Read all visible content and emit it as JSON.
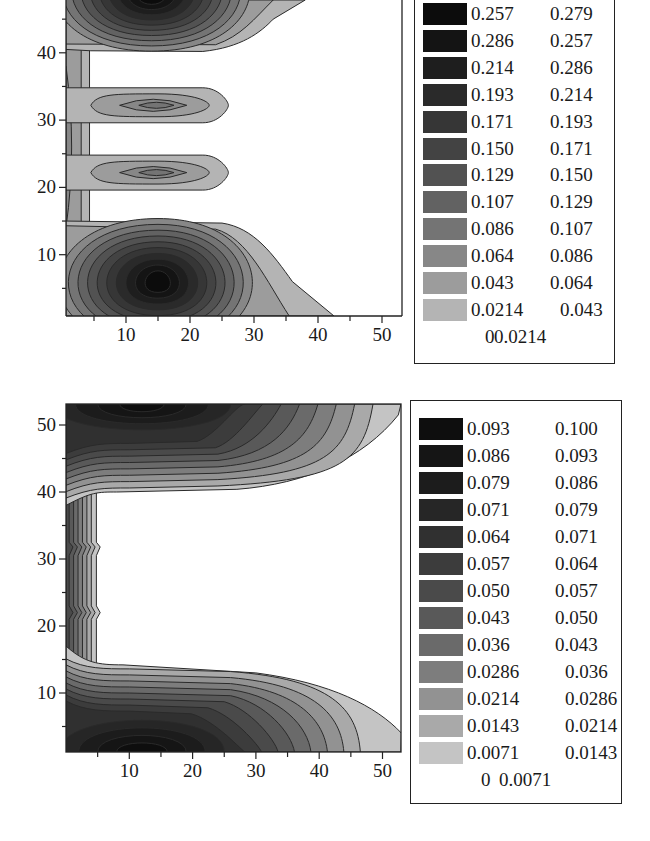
{
  "chart_data": [
    {
      "type": "contour",
      "title": "",
      "xlabel": "",
      "ylabel": "",
      "xlim": [
        0.6,
        53
      ],
      "ylim": [
        1,
        48
      ],
      "x_ticks": [
        10,
        20,
        30,
        40,
        50
      ],
      "y_ticks": [
        10,
        20,
        30,
        40
      ],
      "x_tick_labels": [
        "10",
        "20",
        "30",
        "40",
        "50"
      ],
      "y_tick_labels": [
        "10",
        "20",
        "30",
        "40"
      ],
      "grid": false,
      "legend_position": "right",
      "levels": [
        0,
        0.0214,
        0.043,
        0.064,
        0.086,
        0.107,
        0.129,
        0.15,
        0.171,
        0.193,
        0.214,
        0.286,
        0.257,
        0.279
      ],
      "legend": [
        {
          "lo": "0.257",
          "hi": "0.279",
          "color": "#0c0c0c"
        },
        {
          "lo": "0.286",
          "hi": "0.257",
          "color": "#141414"
        },
        {
          "lo": "0.214",
          "hi": "0.286",
          "color": "#1e1e1e"
        },
        {
          "lo": "0.193",
          "hi": "0.214",
          "color": "#2a2a2a"
        },
        {
          "lo": "0.171",
          "hi": "0.193",
          "color": "#363636"
        },
        {
          "lo": "0.150",
          "hi": "0.171",
          "color": "#434343"
        },
        {
          "lo": "0.129",
          "hi": "0.150",
          "color": "#525252"
        },
        {
          "lo": "0.107",
          "hi": "0.129",
          "color": "#626262"
        },
        {
          "lo": "0.086",
          "hi": "0.107",
          "color": "#747474"
        },
        {
          "lo": "0.064",
          "hi": "0.086",
          "color": "#878787"
        },
        {
          "lo": "0.043",
          "hi": "0.064",
          "color": "#9c9c9c"
        },
        {
          "lo": "0.0214",
          "hi": "0.043",
          "color": "#b4b4b4"
        },
        {
          "lo": "0",
          "hi": "0.0214",
          "color": "none"
        }
      ],
      "features": [
        {
          "kind": "peak",
          "x": 15,
          "y": 6,
          "max_level": 0.279,
          "extent_x": [
            1,
            43
          ],
          "extent_y": [
            1,
            15
          ]
        },
        {
          "kind": "peak",
          "x": 14,
          "y": 49,
          "max_level": 0.279,
          "extent_x": [
            1,
            38
          ],
          "extent_y": [
            40,
            48
          ]
        },
        {
          "kind": "ridge",
          "x": 15,
          "y": 32,
          "max_level": 0.086,
          "extent_x": [
            4,
            26
          ],
          "extent_y": [
            29.5,
            35
          ]
        },
        {
          "kind": "ridge",
          "x": 15,
          "y": 22,
          "max_level": 0.086,
          "extent_x": [
            4,
            26
          ],
          "extent_y": [
            19.5,
            25
          ]
        },
        {
          "kind": "band",
          "x": 2,
          "y": 25,
          "max_level": 0.064,
          "extent_x": [
            0.6,
            5
          ],
          "extent_y": [
            1,
            48
          ]
        }
      ]
    },
    {
      "type": "contour",
      "title": "",
      "xlabel": "",
      "ylabel": "",
      "xlim": [
        0,
        53
      ],
      "ylim": [
        1,
        53
      ],
      "x_ticks": [
        10,
        20,
        30,
        40,
        50
      ],
      "y_ticks": [
        10,
        20,
        30,
        40,
        50
      ],
      "x_tick_labels": [
        "10",
        "20",
        "30",
        "40",
        "50"
      ],
      "y_tick_labels": [
        "10",
        "20",
        "30",
        "40",
        "50"
      ],
      "grid": false,
      "legend_position": "right",
      "levels": [
        0,
        0.0071,
        0.0143,
        0.0214,
        0.0286,
        0.036,
        0.043,
        0.05,
        0.057,
        0.064,
        0.071,
        0.079,
        0.086,
        0.093,
        0.1
      ],
      "legend": [
        {
          "lo": "0.093",
          "hi": "0.100",
          "color": "#0e0e0e"
        },
        {
          "lo": "0.086",
          "hi": "0.093",
          "color": "#151515"
        },
        {
          "lo": "0.079",
          "hi": "0.086",
          "color": "#1c1c1c"
        },
        {
          "lo": "0.071",
          "hi": "0.079",
          "color": "#262626"
        },
        {
          "lo": "0.064",
          "hi": "0.071",
          "color": "#303030"
        },
        {
          "lo": "0.057",
          "hi": "0.064",
          "color": "#3c3c3c"
        },
        {
          "lo": "0.050",
          "hi": "0.057",
          "color": "#4a4a4a"
        },
        {
          "lo": "0.043",
          "hi": "0.050",
          "color": "#595959"
        },
        {
          "lo": "0.036",
          "hi": "0.043",
          "color": "#6a6a6a"
        },
        {
          "lo": "0.0286",
          "hi": "0.036",
          "color": "#7d7d7d"
        },
        {
          "lo": "0.0214",
          "hi": "0.0286",
          "color": "#929292"
        },
        {
          "lo": "0.0143",
          "hi": "0.0214",
          "color": "#a9a9a9"
        },
        {
          "lo": "0.0071",
          "hi": "0.0143",
          "color": "#c4c4c4"
        },
        {
          "lo": "0",
          "hi": "0.0071",
          "color": "none"
        }
      ],
      "features": [
        {
          "kind": "peak",
          "x": 12,
          "y": 52,
          "max_level": 0.1,
          "extent_x": [
            0,
            53
          ],
          "extent_y": [
            40,
            53
          ]
        },
        {
          "kind": "peak",
          "x": 12,
          "y": 2,
          "max_level": 0.1,
          "extent_x": [
            0,
            53
          ],
          "extent_y": [
            1,
            14
          ]
        },
        {
          "kind": "band",
          "x": 2,
          "y": 27,
          "max_level": 0.036,
          "extent_x": [
            0,
            5
          ],
          "extent_y": [
            1,
            53
          ]
        }
      ]
    }
  ]
}
